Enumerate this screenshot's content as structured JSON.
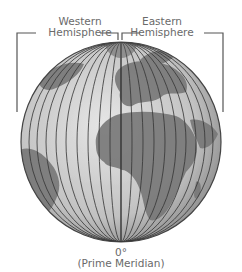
{
  "labels": {
    "western": [
      "Western",
      "Hemisphere"
    ],
    "eastern": [
      "Eastern",
      "Hemisphere"
    ],
    "meridian_degree": "0°",
    "meridian_name": "(Prime Meridian)"
  },
  "colors": {
    "ocean": "#c9c9c9",
    "land": "#7a7a7a",
    "lines": "#333333",
    "bracket": "#555555",
    "text": "#6a6a6a"
  },
  "globe": {
    "meridians_per_side": 9,
    "center_meridian": "0°"
  }
}
